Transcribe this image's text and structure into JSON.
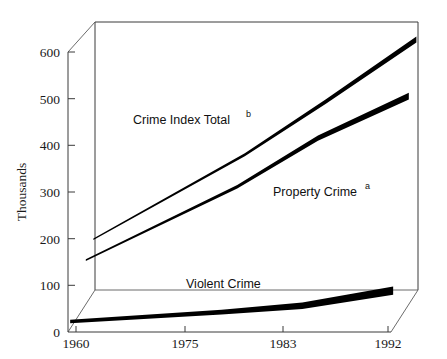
{
  "chart_data": {
    "type": "line",
    "title": "",
    "subtitle": "",
    "xlabel": "",
    "ylabel": "Thousands",
    "x": [
      1960,
      1975,
      1983,
      1992
    ],
    "categories": [
      "1960",
      "1975",
      "1983",
      "1992"
    ],
    "xtick_labels": [
      "1960",
      "1975",
      "1983",
      "1992"
    ],
    "ytick_labels": [
      "0",
      "100",
      "200",
      "300",
      "400",
      "500",
      "600"
    ],
    "ytick_values": [
      0,
      100,
      200,
      300,
      400,
      500,
      600
    ],
    "ylim": [
      0,
      600
    ],
    "grid": false,
    "legend_position": "inline-annotations",
    "projection": "3d-perspective",
    "series": [
      {
        "name": "Crime Index Total",
        "footnote": "b",
        "label_text": "Crime Index Total",
        "label_superscript": "b",
        "color": "#000000",
        "values": [
          120,
          310,
          430,
          570
        ]
      },
      {
        "name": "Property Crime",
        "footnote": "a",
        "label_text": "Property Crime",
        "label_superscript": "a",
        "color": "#000000",
        "values": [
          100,
          265,
          375,
          470
        ]
      },
      {
        "name": "Violent Crime",
        "footnote": "",
        "label_text": "Violent Crime",
        "label_superscript": "",
        "color": "#000000",
        "values": [
          18,
          40,
          55,
          90
        ]
      }
    ]
  },
  "axes": {
    "y_title": "Thousands",
    "y_ticks": [
      {
        "label": "600"
      },
      {
        "label": "500"
      },
      {
        "label": "400"
      },
      {
        "label": "300"
      },
      {
        "label": "200"
      },
      {
        "label": "100"
      },
      {
        "label": "0"
      }
    ],
    "x_ticks": [
      {
        "label": "1960"
      },
      {
        "label": "1975"
      },
      {
        "label": "1983"
      },
      {
        "label": "1992"
      }
    ]
  },
  "annotations": {
    "crime_index_total": "Crime Index Total",
    "crime_index_total_sup": "b",
    "property_crime": "Property Crime",
    "property_crime_sup": "a",
    "violent_crime": "Violent Crime"
  }
}
